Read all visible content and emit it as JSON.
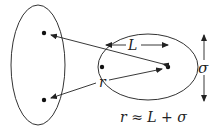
{
  "diagram": {
    "labels": {
      "L": "L",
      "r": "r",
      "sigma": "σ",
      "equation": "r ≈ L + σ"
    },
    "colors": {
      "stroke": "#333333",
      "background": "#ffffff"
    }
  }
}
